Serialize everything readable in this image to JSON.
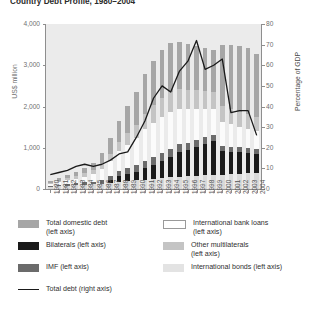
{
  "chart_data": {
    "type": "bar",
    "title": "Country Debt Profile, 1980–2004",
    "xlabel": "",
    "ylabel": "US$ million",
    "ylabel_right": "Percentage of GDP",
    "ylim": [
      0,
      4000
    ],
    "ylim_right": [
      0,
      80
    ],
    "ytick_labels": [
      "4,000",
      "3,000",
      "2,000",
      "1,000",
      "0"
    ],
    "ytick_values": [
      4000,
      3000,
      2000,
      1000,
      0
    ],
    "ytick_labels_right": [
      "80",
      "70",
      "60",
      "50",
      "40",
      "30",
      "20",
      "10",
      "0"
    ],
    "ytick_values_right": [
      80,
      70,
      60,
      50,
      40,
      30,
      20,
      10,
      0
    ],
    "grid": false,
    "legend_position": "bottom",
    "categories": [
      "1980",
      "1981",
      "1982",
      "1983",
      "1984",
      "1985",
      "1986",
      "1987",
      "1988",
      "1989",
      "1990",
      "1991",
      "1992",
      "1993",
      "1994",
      "1995",
      "1996",
      "1997",
      "1998",
      "1999",
      "2000",
      "2001",
      "2002",
      "2003",
      "2004"
    ],
    "stacked": true,
    "series": [
      {
        "name": "International bonds (left axis)",
        "color": "#d9d9d9",
        "axis": "left",
        "values": [
          60,
          70,
          80,
          90,
          100,
          110,
          130,
          150,
          170,
          190,
          210,
          230,
          250,
          270,
          290,
          300,
          310,
          320,
          330,
          340,
          350,
          360,
          370,
          380,
          390
        ]
      },
      {
        "name": "Bilaterals (left axis)",
        "color": "#1a1a1a",
        "axis": "left",
        "values": [
          0,
          0,
          0,
          0,
          0,
          0,
          0,
          60,
          140,
          170,
          200,
          280,
          340,
          400,
          480,
          600,
          630,
          700,
          760,
          820,
          560,
          540,
          520,
          500,
          470
        ]
      },
      {
        "name": "IMF (left axis)",
        "color": "#6b6b6b",
        "axis": "left",
        "values": [
          20,
          30,
          40,
          50,
          60,
          70,
          90,
          110,
          130,
          150,
          170,
          180,
          190,
          200,
          200,
          190,
          180,
          170,
          160,
          150,
          140,
          130,
          120,
          110,
          100
        ]
      },
      {
        "name": "International bank loans (left axis)",
        "color": "#ffffff",
        "axis": "left",
        "values": [
          40,
          60,
          90,
          110,
          140,
          180,
          260,
          360,
          470,
          560,
          650,
          760,
          830,
          880,
          900,
          860,
          820,
          760,
          700,
          640,
          580,
          540,
          500,
          470,
          440
        ]
      },
      {
        "name": "Other multilaterals (left axis)",
        "color": "#c4c4c4",
        "axis": "left",
        "values": [
          30,
          40,
          50,
          60,
          80,
          100,
          140,
          180,
          230,
          280,
          330,
          380,
          420,
          460,
          480,
          470,
          460,
          440,
          420,
          400,
          380,
          370,
          360,
          350,
          340
        ]
      },
      {
        "name": "Total domestic debt (left axis)",
        "color": "#a6a6a6",
        "axis": "left",
        "values": [
          50,
          60,
          80,
          100,
          130,
          180,
          260,
          380,
          520,
          660,
          800,
          950,
          1080,
          1160,
          1200,
          1150,
          1120,
          1080,
          1050,
          1020,
          1480,
          1560,
          1600,
          1620,
          1540
        ]
      }
    ],
    "line_series": {
      "name": "Total debt (right axis)",
      "color": "#1a1a1a",
      "axis": "right",
      "values": [
        7,
        8,
        9,
        11,
        12,
        11,
        12,
        14,
        17,
        18,
        25,
        33,
        44,
        50,
        47,
        57,
        62,
        72,
        58,
        60,
        63,
        37,
        38,
        38,
        26
      ]
    }
  },
  "legend": {
    "items": [
      {
        "label_line1": "Total domestic debt",
        "label_line2": "(left axis)",
        "swatch": "#a6a6a6",
        "type": "swatch",
        "name": "legend-total-domestic-debt"
      },
      {
        "label_line1": "International bank loans",
        "label_line2": "(left axis)",
        "swatch": "#ffffff",
        "type": "swatch-outline",
        "name": "legend-international-bank-loans"
      },
      {
        "label_line1": "Bilaterals (left axis)",
        "label_line2": "",
        "swatch": "#1a1a1a",
        "type": "swatch",
        "name": "legend-bilaterals"
      },
      {
        "label_line1": "Other multilaterals",
        "label_line2": "(left axis)",
        "swatch": "#c4c4c4",
        "type": "swatch",
        "name": "legend-other-multilaterals"
      },
      {
        "label_line1": "IMF (left axis)",
        "label_line2": "",
        "swatch": "#6b6b6b",
        "type": "swatch",
        "name": "legend-imf"
      },
      {
        "label_line1": "International bonds (left axis)",
        "label_line2": "",
        "swatch": "#e3e3e3",
        "type": "swatch",
        "name": "legend-international-bonds"
      },
      {
        "label_line1": "Total debt (right axis)",
        "label_line2": "",
        "swatch": "#1a1a1a",
        "type": "line",
        "name": "legend-total-debt-line"
      }
    ]
  },
  "colors": {
    "plot_background": "#ebebeb",
    "axis": "#8e8e8e",
    "text": "#555555",
    "line": "#1a1a1a"
  }
}
